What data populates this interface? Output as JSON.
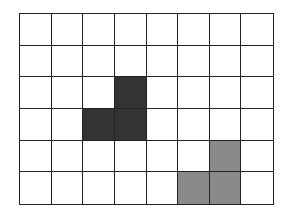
{
  "grid": {
    "rows": 6,
    "cols": 8,
    "line_color": "#222222",
    "empty_color": "#ffffff",
    "shapes": [
      {
        "name": "dark-shape",
        "color": "#333333",
        "cells": [
          [
            2,
            3
          ],
          [
            3,
            2
          ],
          [
            3,
            3
          ]
        ]
      },
      {
        "name": "gray-shape",
        "color": "#8a8a8a",
        "cells": [
          [
            4,
            6
          ],
          [
            5,
            5
          ],
          [
            5,
            6
          ]
        ]
      }
    ]
  }
}
